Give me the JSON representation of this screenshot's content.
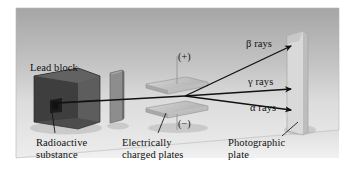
{
  "figure": {
    "background_color": "#ffffff",
    "panel_color_top": "#a9a9a9",
    "panel_color_bottom": "#e9e9e9",
    "ink_color": "#111111"
  },
  "labels": {
    "lead_block": "Lead block",
    "radioactive_substance": "Radioactive\nsubstance",
    "charged_plates": "Electrically\ncharged plates",
    "photographic_plate": "Photographic\nplate",
    "plate_positive": "(+)",
    "plate_negative": "(−)"
  },
  "rays": [
    {
      "id": "beta",
      "symbol": "β",
      "label": "rays",
      "full": "β rays",
      "deflection": "upward",
      "color": "#111111"
    },
    {
      "id": "gamma",
      "symbol": "γ",
      "label": "rays",
      "full": "γ rays",
      "deflection": "none",
      "color": "#111111"
    },
    {
      "id": "alpha",
      "symbol": "α",
      "label": "rays",
      "full": "α rays",
      "deflection": "downward",
      "color": "#111111"
    }
  ],
  "components": {
    "lead_block": {
      "name": "Lead block",
      "color": "#4a4a4a"
    },
    "collimator_slit": {
      "name": "Slit plate",
      "color": "#8a8a8a"
    },
    "upper_plate": {
      "name": "Positive plate",
      "color": "#c5c5c5",
      "polarity": "(+)"
    },
    "lower_plate": {
      "name": "Negative plate",
      "color": "#c5c5c5",
      "polarity": "(−)"
    },
    "photographic_plate": {
      "name": "Photographic plate",
      "color": "#d8d8d8"
    }
  }
}
